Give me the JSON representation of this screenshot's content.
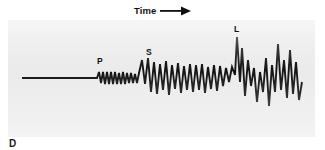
{
  "figure": {
    "kind": "seismogram",
    "part_letter": "D",
    "background_color": "#ffffff",
    "panel_color": "#ebebeb",
    "trace_color": "#121212"
  },
  "axis": {
    "time_label": "Time",
    "arrow_icon": "right-arrow-icon"
  },
  "phase_labels": [
    {
      "id": "P",
      "text": "P",
      "meaning": "P-wave arrival"
    },
    {
      "id": "S",
      "text": "S",
      "meaning": "S-wave arrival"
    },
    {
      "id": "L",
      "text": "L",
      "meaning": "Surface (L) wave arrival"
    }
  ],
  "chart_data": {
    "type": "line",
    "title": "",
    "xlabel": "Time",
    "ylabel": "",
    "grid": false,
    "legend": "none",
    "baseline": 58,
    "xlim": [
      0,
      307
    ],
    "ylim": [
      0,
      117
    ],
    "annotations": [
      {
        "label": "P",
        "x": 92,
        "y": 38
      },
      {
        "label": "S",
        "x": 140,
        "y": 29
      },
      {
        "label": "L",
        "x": 228,
        "y": 6
      }
    ],
    "segments": [
      {
        "name": "pre-arrival flat line",
        "x_start": 14,
        "x_end": 89,
        "amplitude": 0
      },
      {
        "name": "P wave",
        "x_start": 89,
        "x_end": 132,
        "amplitude": 7
      },
      {
        "name": "S wave",
        "x_start": 132,
        "x_end": 222,
        "amplitude": 19
      },
      {
        "name": "L wave",
        "x_start": 222,
        "x_end": 295,
        "amplitude": 34
      }
    ],
    "points": [
      [
        14,
        58
      ],
      [
        89,
        58
      ],
      [
        91,
        52
      ],
      [
        93,
        63
      ],
      [
        95,
        52
      ],
      [
        97,
        64
      ],
      [
        99,
        52
      ],
      [
        101,
        64
      ],
      [
        103,
        52
      ],
      [
        105,
        64
      ],
      [
        107,
        52
      ],
      [
        109,
        64
      ],
      [
        111,
        53
      ],
      [
        113,
        64
      ],
      [
        115,
        52
      ],
      [
        117,
        64
      ],
      [
        119,
        53
      ],
      [
        121,
        63
      ],
      [
        123,
        53
      ],
      [
        125,
        63
      ],
      [
        127,
        54
      ],
      [
        129,
        63
      ],
      [
        131,
        53
      ],
      [
        134,
        40
      ],
      [
        137,
        64
      ],
      [
        140,
        38
      ],
      [
        143,
        72
      ],
      [
        146,
        42
      ],
      [
        149,
        74
      ],
      [
        152,
        44
      ],
      [
        155,
        70
      ],
      [
        158,
        41
      ],
      [
        161,
        75
      ],
      [
        164,
        45
      ],
      [
        167,
        69
      ],
      [
        170,
        43
      ],
      [
        173,
        73
      ],
      [
        176,
        46
      ],
      [
        179,
        70
      ],
      [
        182,
        44
      ],
      [
        185,
        72
      ],
      [
        188,
        45
      ],
      [
        191,
        70
      ],
      [
        194,
        44
      ],
      [
        197,
        73
      ],
      [
        200,
        47
      ],
      [
        203,
        69
      ],
      [
        206,
        45
      ],
      [
        209,
        71
      ],
      [
        212,
        46
      ],
      [
        215,
        66
      ],
      [
        218,
        48
      ],
      [
        221,
        62
      ],
      [
        224,
        47
      ],
      [
        227,
        55
      ],
      [
        229,
        17
      ],
      [
        232,
        62
      ],
      [
        234,
        28
      ],
      [
        237,
        76
      ],
      [
        240,
        40
      ],
      [
        243,
        66
      ],
      [
        246,
        48
      ],
      [
        249,
        82
      ],
      [
        252,
        52
      ],
      [
        255,
        72
      ],
      [
        258,
        38
      ],
      [
        261,
        86
      ],
      [
        264,
        45
      ],
      [
        267,
        72
      ],
      [
        270,
        24
      ],
      [
        273,
        70
      ],
      [
        276,
        40
      ],
      [
        279,
        78
      ],
      [
        282,
        30
      ],
      [
        285,
        74
      ],
      [
        288,
        42
      ],
      [
        291,
        80
      ],
      [
        294,
        62
      ]
    ]
  }
}
